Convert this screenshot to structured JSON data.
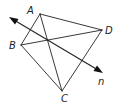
{
  "diagram": {
    "type": "geometry",
    "points": {
      "A": {
        "label": "A",
        "x": 40,
        "y": 14
      },
      "B": {
        "label": "B",
        "x": 21,
        "y": 45
      },
      "C": {
        "label": "C",
        "x": 62,
        "y": 91
      },
      "D": {
        "label": "D",
        "x": 102,
        "y": 30
      }
    },
    "segments": [
      {
        "from": "A",
        "to": "D"
      },
      {
        "from": "D",
        "to": "C"
      },
      {
        "from": "C",
        "to": "B"
      },
      {
        "from": "B",
        "to": "A"
      },
      {
        "from": "A",
        "to": "C"
      },
      {
        "from": "B",
        "to": "D"
      }
    ],
    "line": {
      "label": "n",
      "start": {
        "x": 9,
        "y": 17
      },
      "end": {
        "x": 103,
        "y": 73
      },
      "arrows": "both"
    },
    "labels": {
      "A": "A",
      "B": "B",
      "C": "C",
      "D": "D",
      "n": "n"
    },
    "colors": {
      "stroke": "#222222",
      "background": "#ffffff"
    }
  }
}
